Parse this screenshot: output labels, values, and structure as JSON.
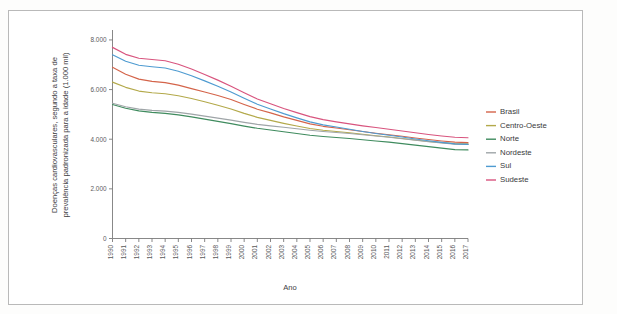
{
  "chart_data": {
    "type": "line",
    "title": "",
    "xlabel": "Ano",
    "ylabel": "Doenças cardiovasculares, segundo a taxa de prevalência padronizada para a idade (1.000 mil)",
    "x": [
      1990,
      1991,
      1992,
      1993,
      1994,
      1995,
      1996,
      1997,
      1998,
      1999,
      2000,
      2001,
      2002,
      2003,
      2004,
      2005,
      2006,
      2007,
      2008,
      2009,
      2010,
      2011,
      2012,
      2013,
      2014,
      2015,
      2016,
      2017
    ],
    "xtick_labels": [
      "1990",
      "1991",
      "1992",
      "1993",
      "1994",
      "1995",
      "1996",
      "1997",
      "1998",
      "1999",
      "2000",
      "2001",
      "2002",
      "2003",
      "2004",
      "2005",
      "2006",
      "2007",
      "2008",
      "2009",
      "2010",
      "2011",
      "2012",
      "2013",
      "2014",
      "2015",
      "2016",
      "2017"
    ],
    "ytick_labels": [
      "0",
      "2.000",
      "4.000",
      "6.000",
      "8.000"
    ],
    "ytick_values": [
      0,
      2000,
      4000,
      6000,
      8000
    ],
    "ylim": [
      0,
      8400
    ],
    "xlim": [
      1990,
      2017
    ],
    "grid": false,
    "legend_position": "right",
    "series": [
      {
        "name": "Brasil",
        "color": "#d4644a",
        "values": [
          6900,
          6620,
          6420,
          6330,
          6280,
          6180,
          6040,
          5900,
          5760,
          5600,
          5400,
          5210,
          5060,
          4900,
          4760,
          4620,
          4520,
          4450,
          4380,
          4310,
          4240,
          4180,
          4120,
          4050,
          3990,
          3930,
          3880,
          3860
        ]
      },
      {
        "name": "Centro-Oeste",
        "color": "#b3a94a",
        "values": [
          6300,
          6090,
          5940,
          5870,
          5830,
          5750,
          5640,
          5510,
          5370,
          5220,
          5040,
          4880,
          4760,
          4640,
          4530,
          4430,
          4360,
          4310,
          4260,
          4200,
          4140,
          4090,
          4030,
          3970,
          3910,
          3860,
          3820,
          3810
        ]
      },
      {
        "name": "Norte",
        "color": "#3f8b5e",
        "values": [
          5400,
          5250,
          5140,
          5080,
          5040,
          4980,
          4900,
          4810,
          4720,
          4630,
          4530,
          4440,
          4370,
          4300,
          4230,
          4160,
          4110,
          4070,
          4030,
          3980,
          3930,
          3880,
          3820,
          3760,
          3700,
          3640,
          3580,
          3570
        ]
      },
      {
        "name": "Nordeste",
        "color": "#9fa5a8",
        "values": [
          5450,
          5310,
          5210,
          5160,
          5130,
          5080,
          5010,
          4930,
          4850,
          4770,
          4680,
          4600,
          4540,
          4480,
          4420,
          4360,
          4310,
          4270,
          4230,
          4180,
          4130,
          4080,
          4020,
          3960,
          3900,
          3850,
          3800,
          3790
        ]
      },
      {
        "name": "Sul",
        "color": "#4e9bd1",
        "values": [
          7400,
          7140,
          6980,
          6920,
          6870,
          6740,
          6560,
          6350,
          6130,
          5900,
          5650,
          5410,
          5220,
          5030,
          4860,
          4700,
          4580,
          4490,
          4400,
          4310,
          4230,
          4160,
          4090,
          4010,
          3940,
          3870,
          3810,
          3790
        ]
      },
      {
        "name": "Sudeste",
        "color": "#d8547e",
        "values": [
          7700,
          7420,
          7260,
          7210,
          7160,
          7020,
          6830,
          6610,
          6380,
          6130,
          5870,
          5620,
          5430,
          5240,
          5070,
          4910,
          4790,
          4700,
          4620,
          4540,
          4470,
          4400,
          4330,
          4260,
          4190,
          4130,
          4080,
          4060
        ]
      }
    ]
  },
  "legend": {
    "items": [
      {
        "label": "Brasil"
      },
      {
        "label": "Centro-Oeste"
      },
      {
        "label": "Norte"
      },
      {
        "label": "Nordeste"
      },
      {
        "label": "Sul"
      },
      {
        "label": "Sudeste"
      }
    ]
  }
}
